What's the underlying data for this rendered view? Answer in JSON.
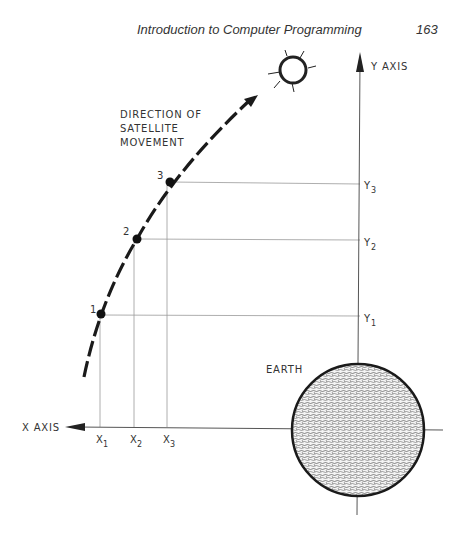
{
  "header": {
    "title": "Introduction to Computer Programming",
    "page_number": "163"
  },
  "diagram": {
    "direction_label": [
      "DIRECTION OF",
      "SATELLITE",
      "MOVEMENT"
    ],
    "y_axis_label": "Y AXIS",
    "x_axis_label": "X AXIS",
    "earth_label": "EARTH",
    "points": [
      {
        "label": "1",
        "x_label": "X",
        "x_sub": "1",
        "y_label": "Y",
        "y_sub": "1"
      },
      {
        "label": "2",
        "x_label": "X",
        "x_sub": "2",
        "y_label": "Y",
        "y_sub": "2"
      },
      {
        "label": "3",
        "x_label": "X",
        "x_sub": "3",
        "y_label": "Y",
        "y_sub": "3"
      }
    ],
    "icons": [
      "sun-icon",
      "earth-icon",
      "direction-arrow-icon"
    ]
  }
}
